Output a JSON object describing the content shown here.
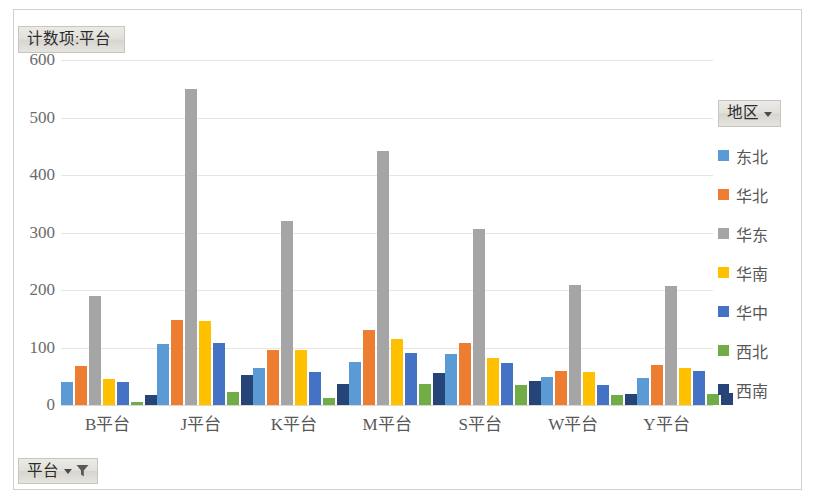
{
  "pivot": {
    "value_field_label": "计数项:平台",
    "page_field_label": "平台",
    "legend_field_label": "地区",
    "dropdown_icon": "chevron-down-icon",
    "filter_icon": "funnel-filter-icon"
  },
  "chart_data": {
    "type": "bar",
    "title": "计数项:平台",
    "xlabel": "",
    "ylabel": "",
    "ylim": [
      0,
      600
    ],
    "yticks": [
      0,
      100,
      200,
      300,
      400,
      500,
      600
    ],
    "grid": true,
    "legend_position": "right",
    "legend_title": "地区",
    "categories": [
      "B平台",
      "J平台",
      "K平台",
      "M平台",
      "S平台",
      "W平台",
      "Y平台"
    ],
    "series": [
      {
        "name": "东北",
        "color": "#5B9BD5",
        "values": [
          40,
          106,
          64,
          75,
          88,
          48,
          47
        ]
      },
      {
        "name": "华北",
        "color": "#ED7D31",
        "values": [
          67,
          147,
          96,
          130,
          107,
          60,
          69
        ]
      },
      {
        "name": "华东",
        "color": "#A5A5A5",
        "values": [
          190,
          550,
          320,
          441,
          306,
          208,
          207
        ]
      },
      {
        "name": "华南",
        "color": "#FFC000",
        "values": [
          45,
          146,
          95,
          114,
          82,
          57,
          64
        ]
      },
      {
        "name": "华中",
        "color": "#4472C4",
        "values": [
          40,
          107,
          58,
          90,
          73,
          34,
          60
        ]
      },
      {
        "name": "西北",
        "color": "#70AD47",
        "values": [
          5,
          22,
          13,
          36,
          35,
          18,
          20
        ]
      },
      {
        "name": "西南",
        "color": "#264478",
        "values": [
          18,
          52,
          37,
          56,
          41,
          20,
          21
        ]
      }
    ]
  }
}
